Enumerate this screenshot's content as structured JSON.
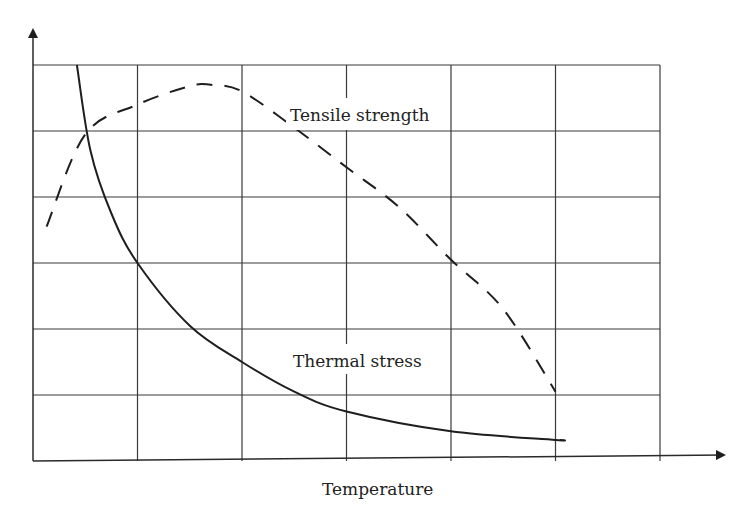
{
  "chart_data": {
    "type": "line",
    "title": "",
    "xlabel": "Temperature",
    "ylabel": "",
    "grid": true,
    "grid_columns": 6,
    "grid_rows": 6,
    "x_ticks": [],
    "y_ticks": [],
    "legend": "inline annotations",
    "xlim": [
      0,
      6
    ],
    "ylim": [
      0,
      6
    ],
    "series": [
      {
        "name": "Tensile strength",
        "style": "dashed",
        "x": [
          0.13,
          0.5,
          1.0,
          1.5,
          1.7,
          2.0,
          2.5,
          3.0,
          3.5,
          4.0,
          4.5,
          5.0
        ],
        "y": [
          3.55,
          4.95,
          5.4,
          5.68,
          5.7,
          5.6,
          5.05,
          4.45,
          3.85,
          3.05,
          2.3,
          1.05
        ]
      },
      {
        "name": "Thermal stress",
        "style": "solid",
        "x": [
          0.42,
          0.55,
          0.75,
          1.0,
          1.5,
          2.0,
          2.5,
          3.0,
          4.0,
          5.0,
          5.05
        ],
        "y": [
          6.0,
          4.7,
          3.75,
          3.0,
          2.05,
          1.5,
          1.05,
          0.75,
          0.45,
          0.32,
          0.32
        ]
      }
    ],
    "annotations": [
      {
        "text": "Tensile strength",
        "x": 3.3,
        "y": 5.3
      },
      {
        "text": "Thermal stress",
        "x": 2.75,
        "y": 1.55
      }
    ]
  },
  "labels": {
    "xlabel": "Temperature",
    "tensile": "Tensile strength",
    "thermal": "Thermal stress"
  }
}
